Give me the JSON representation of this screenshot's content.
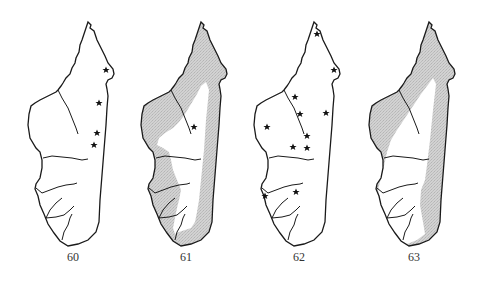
{
  "figure": {
    "panels": [
      {
        "number": "60",
        "type": "point-records",
        "label_x": 73,
        "offset_x": 0,
        "shading": false,
        "stars": [
          [
            106,
            70
          ],
          [
            99,
            103
          ],
          [
            97,
            133
          ],
          [
            94,
            145
          ]
        ]
      },
      {
        "number": "61",
        "type": "range-shading",
        "label_x": 186,
        "offset_x": 113,
        "shading": true,
        "stars": [
          [
            194,
            127
          ]
        ]
      },
      {
        "number": "62",
        "type": "point-records",
        "label_x": 299,
        "offset_x": 226,
        "shading": false,
        "stars": [
          [
            317,
            34
          ],
          [
            334,
            70
          ],
          [
            295,
            97
          ],
          [
            300,
            114
          ],
          [
            326,
            113
          ],
          [
            267,
            127
          ],
          [
            307,
            136
          ],
          [
            293,
            147
          ],
          [
            307,
            148
          ],
          [
            265,
            196
          ],
          [
            296,
            192
          ]
        ]
      },
      {
        "number": "63",
        "type": "range-shading",
        "label_x": 414,
        "offset_x": 341,
        "shading": true,
        "stars": []
      }
    ],
    "colors": {
      "outline": "#1a1a1a",
      "shading": "#c8c8c8",
      "star": "#111111",
      "label": "#333333"
    }
  }
}
